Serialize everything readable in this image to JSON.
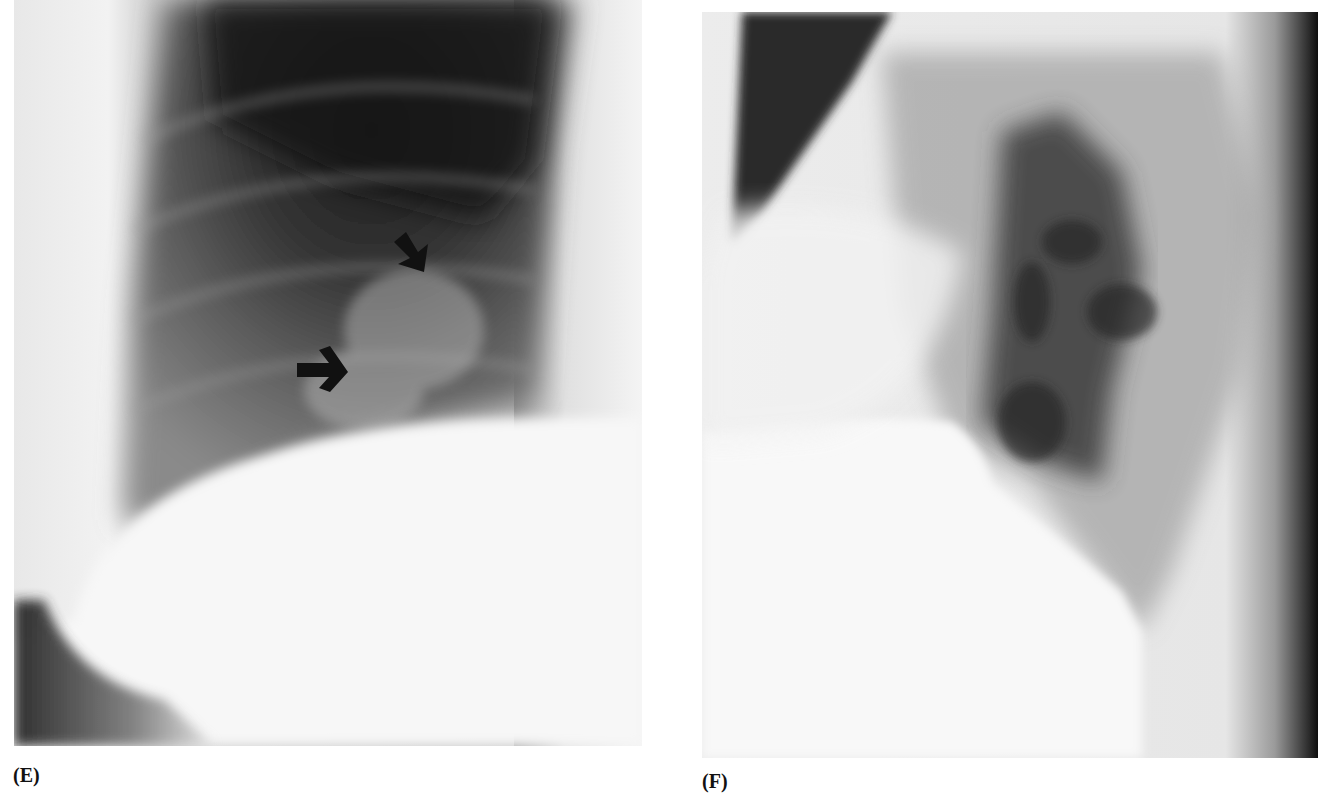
{
  "figure": {
    "panels": [
      {
        "id": "E",
        "label": "(E)",
        "content": "Chest radiograph (frontal/oblique view) with two black arrows indicating findings in the lower lung zone above the diaphragm",
        "annotations": [
          {
            "type": "arrow",
            "direction": "down-right",
            "approx_position": [
              405,
              255
            ]
          },
          {
            "type": "arrow",
            "direction": "right",
            "approx_position": [
              320,
              372
            ]
          }
        ]
      },
      {
        "id": "F",
        "label": "(F)",
        "content": "Lateral chest radiograph showing hilar markings and diaphragm"
      }
    ],
    "colors": {
      "background": "#ffffff",
      "label": "#111111",
      "arrow": "#111111"
    }
  }
}
